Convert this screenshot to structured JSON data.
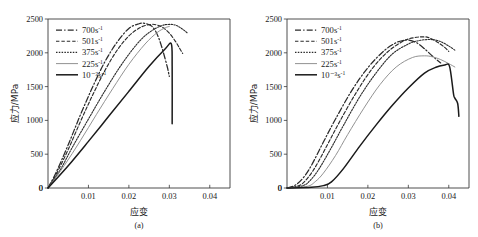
{
  "figure": {
    "background_color": "#ffffff",
    "panel_count": 2
  },
  "panels": [
    {
      "id": "a",
      "caption": "(a)",
      "xlabel": "应变",
      "ylabel": "应力/MPa",
      "xticks": [
        "0",
        "0.01",
        "0.02",
        "0.03",
        "0.04"
      ],
      "yticks": [
        "0",
        "500",
        "1000",
        "1500",
        "2000",
        "2500"
      ]
    },
    {
      "id": "b",
      "caption": "(b)",
      "xlabel": "应变",
      "ylabel": "应力/MPa",
      "xticks": [
        "0",
        "0.01",
        "0.02",
        "0.03",
        "0.04"
      ],
      "yticks": [
        "0",
        "500",
        "1000",
        "1500",
        "2000",
        "2500"
      ]
    }
  ],
  "legend": {
    "entries": [
      {
        "base": "700s",
        "exp": "-1",
        "style": "dashdot",
        "color": "#2b2b2b",
        "width": 1.25
      },
      {
        "base": "501s",
        "exp": "-1",
        "style": "dashed",
        "color": "#2b2b2b",
        "width": 1.15
      },
      {
        "base": "375s",
        "exp": "-1",
        "style": "dotted",
        "color": "#2b2b2b",
        "width": 1.1
      },
      {
        "base": "225s",
        "exp": "-1",
        "style": "thin-solid",
        "color": "#8c8c8c",
        "width": 0.95
      },
      {
        "base": "10⁻³s",
        "exp": "-1",
        "style": "solid",
        "color": "#1a1a1a",
        "width": 1.5
      }
    ]
  },
  "chart_data": [
    {
      "type": "line",
      "panel": "a",
      "title": "(a)",
      "xlabel": "应变",
      "ylabel": "应力/MPa",
      "xlim": [
        0,
        0.045
      ],
      "ylim": [
        0,
        2500
      ],
      "xticks": [
        0,
        0.01,
        0.02,
        0.03,
        0.04
      ],
      "yticks": [
        0,
        500,
        1000,
        1500,
        2000,
        2500
      ],
      "grid": false,
      "legend_position": "upper-left",
      "series": [
        {
          "name": "700s-1",
          "x": [
            0,
            0.002,
            0.005,
            0.008,
            0.011,
            0.014,
            0.017,
            0.02,
            0.0225,
            0.024,
            0.0255,
            0.0265,
            0.0275,
            0.0285,
            0.0295,
            0.03
          ],
          "y": [
            0,
            230,
            640,
            1080,
            1490,
            1860,
            2150,
            2360,
            2430,
            2435,
            2400,
            2330,
            2200,
            2010,
            1790,
            1650
          ]
        },
        {
          "name": "501s-1",
          "x": [
            0,
            0.002,
            0.005,
            0.008,
            0.011,
            0.014,
            0.017,
            0.02,
            0.023,
            0.0255,
            0.027,
            0.0285,
            0.03,
            0.0315,
            0.0325,
            0.0333
          ],
          "y": [
            0,
            200,
            570,
            980,
            1370,
            1730,
            2030,
            2250,
            2380,
            2420,
            2410,
            2370,
            2290,
            2170,
            2070,
            1990
          ]
        },
        {
          "name": "375s-1",
          "x": [
            0,
            0.003,
            0.006,
            0.01,
            0.014,
            0.018,
            0.022,
            0.025,
            0.028,
            0.03,
            0.0315,
            0.0325,
            0.0335,
            0.0345
          ],
          "y": [
            0,
            265,
            600,
            1020,
            1430,
            1810,
            2130,
            2300,
            2400,
            2420,
            2410,
            2380,
            2340,
            2290
          ]
        },
        {
          "name": "225s-1",
          "x": [
            0,
            0.004,
            0.008,
            0.012,
            0.016,
            0.02,
            0.024,
            0.027,
            0.029,
            0.03
          ],
          "y": [
            0,
            330,
            700,
            1090,
            1470,
            1830,
            2130,
            2300,
            2370,
            2390
          ]
        },
        {
          "name": "10-3s-1",
          "x": [
            0,
            0.005,
            0.01,
            0.015,
            0.02,
            0.025,
            0.029,
            0.0305,
            0.0307,
            0.0307
          ],
          "y": [
            0,
            330,
            690,
            1060,
            1430,
            1800,
            2060,
            2130,
            1800,
            950
          ]
        }
      ]
    },
    {
      "type": "line",
      "panel": "b",
      "title": "(b)",
      "xlabel": "应变",
      "ylabel": "应力/MPa",
      "xlim": [
        0,
        0.045
      ],
      "ylim": [
        0,
        2500
      ],
      "xticks": [
        0,
        0.01,
        0.02,
        0.03,
        0.04
      ],
      "yticks": [
        0,
        500,
        1000,
        1500,
        2000,
        2500
      ],
      "grid": false,
      "legend_position": "upper-left",
      "series": [
        {
          "name": "700s-1",
          "x": [
            0,
            0.002,
            0.004,
            0.006,
            0.009,
            0.012,
            0.016,
            0.02,
            0.024,
            0.027,
            0.029,
            0.03,
            0.032,
            0.034,
            0.036,
            0.038
          ],
          "y": [
            0,
            40,
            150,
            330,
            680,
            1020,
            1440,
            1780,
            2030,
            2150,
            2185,
            2190,
            2150,
            2060,
            1950,
            1850
          ]
        },
        {
          "name": "501s-1",
          "x": [
            0,
            0.003,
            0.005,
            0.007,
            0.01,
            0.013,
            0.017,
            0.021,
            0.025,
            0.029,
            0.032,
            0.034,
            0.035,
            0.037,
            0.039,
            0.04
          ],
          "y": [
            0,
            35,
            140,
            310,
            640,
            980,
            1400,
            1760,
            2020,
            2180,
            2230,
            2235,
            2225,
            2165,
            2080,
            2020
          ]
        },
        {
          "name": "375s-1",
          "x": [
            0,
            0.004,
            0.006,
            0.008,
            0.011,
            0.014,
            0.018,
            0.022,
            0.026,
            0.03,
            0.033,
            0.036,
            0.038,
            0.04,
            0.0415
          ],
          "y": [
            0,
            35,
            130,
            290,
            600,
            930,
            1350,
            1700,
            1980,
            2130,
            2185,
            2195,
            2165,
            2100,
            2040
          ]
        },
        {
          "name": "225s-1",
          "x": [
            0,
            0.005,
            0.007,
            0.009,
            0.012,
            0.015,
            0.019,
            0.023,
            0.027,
            0.031,
            0.034,
            0.036,
            0.038,
            0.04,
            0.0415
          ],
          "y": [
            0,
            25,
            95,
            220,
            480,
            790,
            1180,
            1530,
            1790,
            1930,
            1955,
            1940,
            1900,
            1840,
            1790
          ]
        },
        {
          "name": "10-3s-1",
          "x": [
            0,
            0.006,
            0.009,
            0.011,
            0.014,
            0.018,
            0.022,
            0.026,
            0.03,
            0.034,
            0.037,
            0.039,
            0.04,
            0.0405,
            0.0412,
            0.0415,
            0.0422,
            0.0425
          ],
          "y": [
            0,
            10,
            35,
            90,
            290,
            620,
            930,
            1220,
            1480,
            1700,
            1790,
            1820,
            1825,
            1700,
            1380,
            1330,
            1250,
            1060
          ]
        }
      ]
    }
  ]
}
